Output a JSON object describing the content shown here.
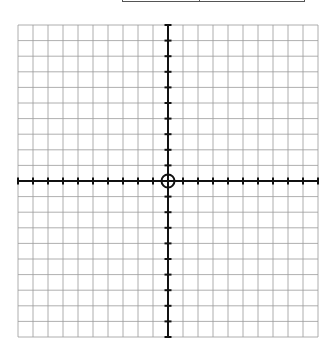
{
  "table_fragment": {
    "cells": [
      "",
      ""
    ]
  },
  "grid": {
    "columns": 20,
    "rows": 20,
    "x_min": -10,
    "x_max": 10,
    "y_min": -10,
    "y_max": 10,
    "grid_color": "#9a9a9a",
    "axis_color": "#111111",
    "origin_marker": "circle"
  }
}
